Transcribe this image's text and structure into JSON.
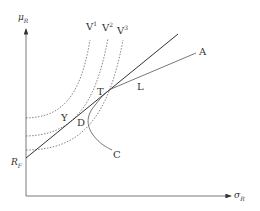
{
  "diagram": {
    "axes": {
      "y_label": "μ",
      "y_label_sub": "R",
      "x_label": "σ",
      "x_label_sub": "R"
    },
    "points": {
      "risk_free": "R",
      "risk_free_sub": "F",
      "tangency": "T",
      "Y": "Y",
      "D": "D",
      "L": "L"
    },
    "curves": {
      "indifference": [
        {
          "label": "V",
          "sup": "1"
        },
        {
          "label": "V",
          "sup": "2"
        },
        {
          "label": "V",
          "sup": "3"
        }
      ],
      "frontier_label": "A",
      "lower_curve_label": "C"
    },
    "colors": {
      "lines": "#444444",
      "dotted": "#666666",
      "text": "#333333"
    }
  }
}
